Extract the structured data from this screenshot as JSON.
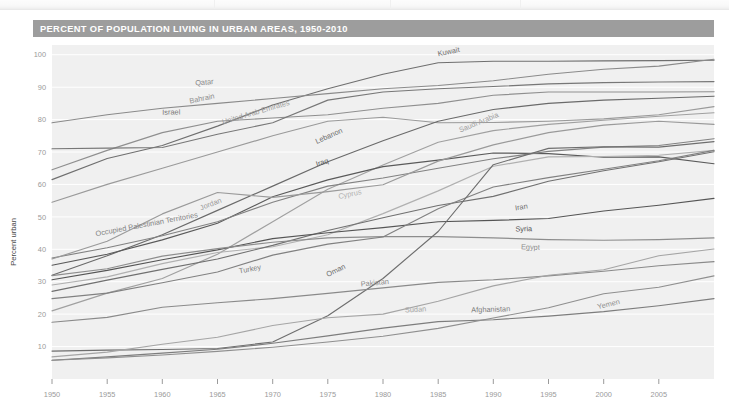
{
  "header": {
    "title": "PERCENT OF POPULATION LIVING IN URBAN AREAS, 1950-2010",
    "bar_color": "#9d9d9d",
    "text_color": "#ffffff"
  },
  "chart_data": {
    "type": "line",
    "title": "PERCENT OF POPULATION LIVING IN URBAN AREAS, 1950-2010",
    "xlabel": "",
    "ylabel": "Percent urban",
    "xlim": [
      1950,
      2010
    ],
    "ylim": [
      0,
      103
    ],
    "grid": true,
    "grid_orientation": "horizontal",
    "legend": "inline-labels",
    "x_ticks": [
      1950,
      1955,
      1960,
      1965,
      1970,
      1975,
      1980,
      1985,
      1990,
      1995,
      2000,
      2005
    ],
    "y_ticks": [
      10,
      20,
      30,
      40,
      50,
      60,
      70,
      80,
      90,
      100
    ],
    "x": [
      1950,
      1955,
      1960,
      1965,
      1970,
      1975,
      1980,
      1985,
      1990,
      1995,
      2000,
      2005,
      2010
    ],
    "series": [
      {
        "name": "Kuwait",
        "color": "#6f6f6f",
        "label_x": 1985,
        "label_y": 99.5,
        "values": [
          61.5,
          68.0,
          72.0,
          78.0,
          84.5,
          89.5,
          94.0,
          97.5,
          98.0,
          98.0,
          98.1,
          98.2,
          98.3
        ]
      },
      {
        "name": "Qatar",
        "color": "#8a8a8a",
        "label_x": 1963,
        "label_y": 90.5,
        "values": [
          79.0,
          81.5,
          83.5,
          85.0,
          86.5,
          88.0,
          89.5,
          90.5,
          92.0,
          94.0,
          95.5,
          96.5,
          98.6
        ]
      },
      {
        "name": "Bahrain",
        "color": "#8f8f8f",
        "label_x": 1962.5,
        "label_y": 85.0,
        "values": [
          64.5,
          70.5,
          76.0,
          79.5,
          80.5,
          81.5,
          83.5,
          85.0,
          87.5,
          88.5,
          88.5,
          88.5,
          88.6
        ]
      },
      {
        "name": "Israel",
        "color": "#777777",
        "label_x": 1960,
        "label_y": 81.5,
        "values": [
          71.0,
          71.2,
          71.4,
          75.5,
          79.0,
          86.0,
          88.5,
          89.5,
          90.2,
          91.0,
          91.4,
          91.6,
          91.7
        ]
      },
      {
        "name": "United Arab Emirates",
        "color": "#9a9a9a",
        "label_x": 1965.5,
        "label_y": 78.5,
        "values": [
          54.5,
          60.0,
          65.0,
          70.0,
          75.0,
          79.5,
          80.7,
          79.0,
          79.1,
          79.5,
          80.2,
          81.5,
          84.0
        ]
      },
      {
        "name": "Lebanon",
        "color": "#6a6a6a",
        "label_x": 1974,
        "label_y": 72.5,
        "values": [
          32.0,
          38.0,
          44.5,
          52.0,
          59.5,
          67.0,
          73.5,
          79.5,
          83.1,
          85.0,
          86.0,
          86.6,
          87.2
        ]
      },
      {
        "name": "Saudi Arabia",
        "color": "#a0a0a0",
        "label_x": 1987,
        "label_y": 76.0,
        "values": [
          21.0,
          26.5,
          31.0,
          38.5,
          48.5,
          58.5,
          66.0,
          73.0,
          76.6,
          78.5,
          79.8,
          81.0,
          82.1
        ]
      },
      {
        "name": "Iraq",
        "color": "#5a5a5a",
        "label_x": 1974,
        "label_y": 65.5,
        "values": [
          35.1,
          38.5,
          42.9,
          48.0,
          56.2,
          61.4,
          65.5,
          67.5,
          69.7,
          69.5,
          68.4,
          68.5,
          66.4
        ]
      },
      {
        "name": "Cyprus",
        "color": "#b0b0b0",
        "label_x": 1976,
        "label_y": 55.5,
        "values": [
          29.0,
          31.5,
          35.6,
          39.0,
          40.8,
          44.5,
          51.0,
          58.0,
          65.6,
          68.5,
          68.6,
          69.0,
          70.5
        ]
      },
      {
        "name": "Iran",
        "color": "#707070",
        "label_x": 1992,
        "label_y": 52.0,
        "values": [
          27.0,
          30.5,
          33.8,
          37.0,
          41.2,
          45.8,
          49.7,
          53.5,
          56.3,
          61.0,
          64.2,
          67.0,
          70.1
        ]
      },
      {
        "name": "Syria",
        "color": "#555555",
        "label_x": 1992,
        "label_y": 45.5,
        "values": [
          30.6,
          33.5,
          36.8,
          39.8,
          43.3,
          45.1,
          46.7,
          48.5,
          48.9,
          49.5,
          51.8,
          53.6,
          55.7
        ]
      },
      {
        "name": "Egypt",
        "color": "#8d8d8d",
        "label_x": 1992.5,
        "label_y": 40.0,
        "values": [
          31.9,
          34.0,
          37.9,
          40.2,
          42.2,
          43.5,
          43.9,
          43.9,
          43.5,
          43.0,
          42.8,
          43.0,
          43.5
        ]
      },
      {
        "name": "Occupied Palestinian Territories",
        "color": "#828282",
        "label_x": 1954,
        "label_y": 44.0,
        "values": [
          37.3,
          40.5,
          44.2,
          48.5,
          54.5,
          59.5,
          62.0,
          65.0,
          67.9,
          70.2,
          71.5,
          72.0,
          74.1
        ]
      },
      {
        "name": "Jordan",
        "color": "#9a9a9a",
        "label_x": 1963.5,
        "label_y": 52.0,
        "values": [
          37.0,
          42.5,
          50.9,
          57.5,
          56.0,
          57.8,
          59.9,
          67.2,
          72.2,
          76.0,
          78.3,
          79.5,
          78.5
        ]
      },
      {
        "name": "Turkey",
        "color": "#818181",
        "label_x": 1967,
        "label_y": 32.5,
        "values": [
          24.8,
          26.5,
          29.7,
          33.0,
          38.2,
          41.6,
          43.8,
          52.5,
          59.2,
          62.1,
          64.7,
          67.3,
          70.5
        ]
      },
      {
        "name": "Oman",
        "color": "#6e6e6e",
        "label_x": 1975,
        "label_y": 31.5,
        "values": [
          8.6,
          8.9,
          9.1,
          9.4,
          11.4,
          19.5,
          31.0,
          45.5,
          66.1,
          71.1,
          71.6,
          71.5,
          73.2
        ]
      },
      {
        "name": "Pakistan",
        "color": "#8a8a8a",
        "label_x": 1978,
        "label_y": 28.5,
        "values": [
          17.5,
          19.0,
          22.1,
          23.5,
          24.8,
          26.4,
          28.1,
          29.8,
          30.6,
          31.8,
          33.2,
          34.9,
          36.2
        ]
      },
      {
        "name": "Sudan",
        "color": "#a5a5a5",
        "label_x": 1982,
        "label_y": 20.5,
        "values": [
          6.8,
          8.3,
          10.7,
          12.9,
          16.5,
          18.9,
          20.0,
          24.0,
          28.7,
          32.0,
          33.7,
          38.0,
          40.1
        ]
      },
      {
        "name": "Afghanistan",
        "color": "#7d7d7d",
        "label_x": 1988,
        "label_y": 20.5,
        "values": [
          5.8,
          6.8,
          8.0,
          9.2,
          11.0,
          13.3,
          15.7,
          17.7,
          18.3,
          19.4,
          20.8,
          22.6,
          24.8
        ]
      },
      {
        "name": "Yemen",
        "color": "#8f8f8f",
        "label_x": 1999.5,
        "label_y": 21.5,
        "values": [
          5.8,
          6.5,
          7.4,
          8.5,
          9.8,
          11.4,
          13.2,
          15.6,
          18.8,
          22.0,
          26.3,
          28.3,
          31.8
        ]
      }
    ]
  },
  "plot": {
    "background": "#f0f0f0",
    "gridline_color": "#ffffff",
    "tick_color": "#9a9a9a"
  }
}
